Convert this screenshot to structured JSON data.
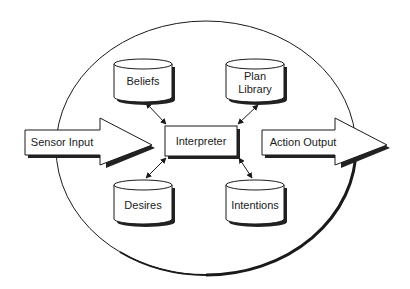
{
  "diagram": {
    "type": "BDI agent architecture",
    "colors": {
      "line": "#1a1a1a",
      "shadow": "#222222",
      "fill": "#ffffff",
      "background": "#ffffff"
    },
    "boundary": {
      "shape": "ellipse"
    },
    "inputs": {
      "sensor": {
        "label": "Sensor Input",
        "shape": "arrow-right"
      }
    },
    "outputs": {
      "action": {
        "label": "Action Output",
        "shape": "arrow-right"
      }
    },
    "center": {
      "label": "Interpreter",
      "shape": "box"
    },
    "stores": [
      {
        "id": "beliefs",
        "label": "Beliefs",
        "label_lines": [
          "Beliefs"
        ],
        "shape": "cylinder"
      },
      {
        "id": "plan-library",
        "label": "Plan Library",
        "label_lines": [
          "Plan",
          "Library"
        ],
        "shape": "cylinder"
      },
      {
        "id": "desires",
        "label": "Desires",
        "label_lines": [
          "Desires"
        ],
        "shape": "cylinder"
      },
      {
        "id": "intentions",
        "label": "Intentions",
        "label_lines": [
          "Intentions"
        ],
        "shape": "cylinder"
      }
    ],
    "connections": [
      {
        "from": "beliefs",
        "to": "interpreter",
        "type": "bidirectional"
      },
      {
        "from": "plan-library",
        "to": "interpreter",
        "type": "bidirectional"
      },
      {
        "from": "desires",
        "to": "interpreter",
        "type": "bidirectional"
      },
      {
        "from": "intentions",
        "to": "interpreter",
        "type": "bidirectional"
      },
      {
        "from": "sensor-input",
        "to": "interpreter",
        "type": "flow"
      },
      {
        "from": "interpreter",
        "to": "action-output",
        "type": "flow"
      }
    ]
  }
}
